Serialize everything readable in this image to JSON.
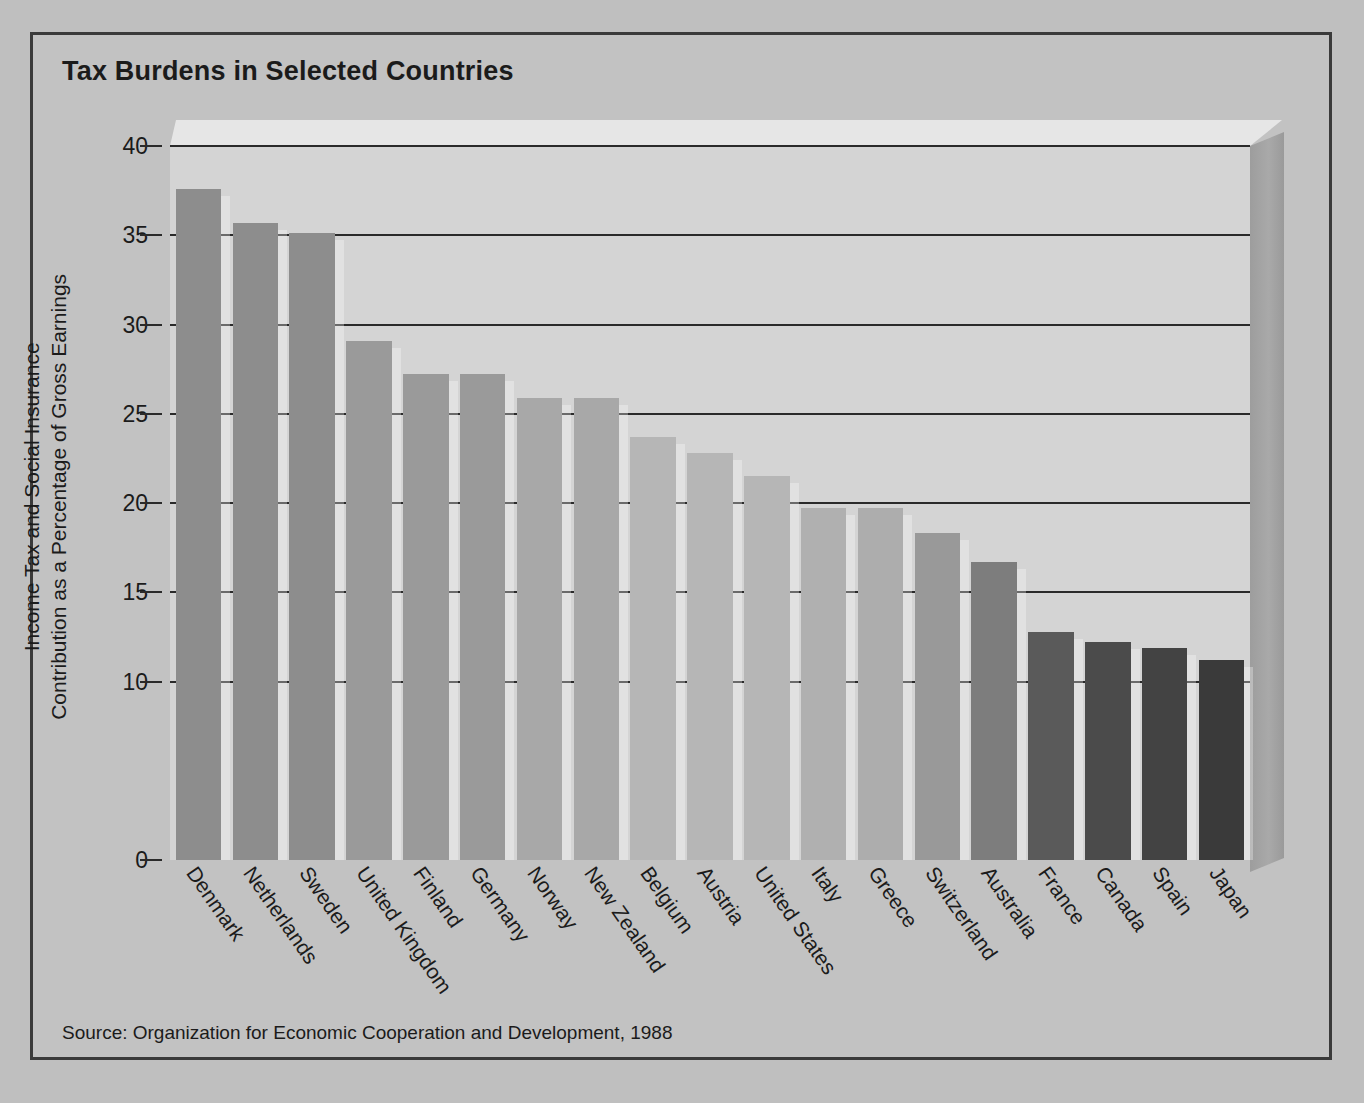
{
  "figure": {
    "title": "Tax Burdens in Selected Countries",
    "source": "Source: Organization for Economic Cooperation and Development, 1988",
    "axis_title_line1": "Income Tax and Social Insurance",
    "axis_title_line2": "Contribution as a Percentage of Gross Earnings"
  },
  "chart_data": {
    "type": "bar",
    "title": "Tax Burdens in Selected Countries",
    "xlabel": "",
    "ylabel": "Income Tax and Social Insurance Contribution as a Percentage of Gross Earnings",
    "ylim": [
      0,
      40
    ],
    "yticks": [
      0,
      10,
      15,
      20,
      25,
      30,
      35,
      40
    ],
    "ytick_labels": [
      "0",
      "10",
      "15",
      "20",
      "25",
      "30",
      "35",
      "40"
    ],
    "grid": true,
    "legend": "none",
    "categories": [
      "Denmark",
      "Netherlands",
      "Sweden",
      "United Kingdom",
      "Finland",
      "Germany",
      "Norway",
      "New Zealand",
      "Belgium",
      "Austria",
      "United States",
      "Italy",
      "Greece",
      "Switzerland",
      "Australia",
      "France",
      "Canada",
      "Spain",
      "Japan"
    ],
    "values": [
      37.6,
      35.7,
      35.1,
      29.1,
      27.2,
      27.2,
      25.9,
      25.9,
      23.7,
      22.8,
      21.5,
      19.7,
      19.7,
      18.3,
      16.7,
      12.8,
      12.2,
      11.9,
      11.2
    ],
    "bar_colors": [
      "#8d8d8d",
      "#8d8d8d",
      "#8d8d8d",
      "#9a9a9a",
      "#9a9a9a",
      "#9a9a9a",
      "#a8a8a8",
      "#a8a8a8",
      "#b6b6b6",
      "#b6b6b6",
      "#b6b6b6",
      "#b0b0b0",
      "#adadad",
      "#999999",
      "#7d7d7d",
      "#5a5a5a",
      "#4b4b4b",
      "#434343",
      "#3a3a3a"
    ]
  },
  "colors": {
    "page_background": "#bfbfbf",
    "panel_background": "#d4d4d4",
    "frame_border": "#3a3a3a",
    "gridline": "#2a2a2a",
    "text": "#1b1b1b",
    "wall_right": "#a3a3a3",
    "wall_top": "#e6e6e6"
  }
}
